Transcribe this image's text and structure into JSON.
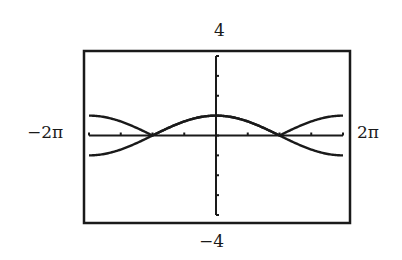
{
  "chart_data": {
    "type": "line",
    "title": "",
    "xlabel": "",
    "ylabel": "",
    "window": {
      "xmin_label": "-2π",
      "xmax_label": "2π",
      "ymin_label": "-4",
      "ymax_label": "4",
      "xmin": -6.2832,
      "xmax": 6.2832,
      "ymin": -4,
      "ymax": 4,
      "xscale_label": "π/2",
      "yscale": 1
    },
    "x_ticks": [
      "-3π/2",
      "-π",
      "-π/2",
      "0",
      "π/2",
      "π",
      "3π/2"
    ],
    "y_ticks": [
      -4,
      -3,
      -2,
      -1,
      0,
      1,
      2,
      3,
      4
    ],
    "grid": false,
    "legend": null,
    "series": [
      {
        "name": "y = cos(x/2)",
        "x": [
          -6.283,
          -4.712,
          -3.142,
          -1.571,
          0,
          1.571,
          3.142,
          4.712,
          6.283
        ],
        "y": [
          -1,
          -0.707,
          0,
          0.707,
          1,
          0.707,
          0,
          -0.707,
          -1
        ]
      },
      {
        "name": "y = |cos(x/2)|",
        "x": [
          -6.283,
          -4.712,
          -3.142,
          -1.571,
          0,
          1.571,
          3.142,
          4.712,
          6.283
        ],
        "y": [
          1,
          0.707,
          0,
          0.707,
          1,
          0.707,
          0,
          0.707,
          1
        ]
      }
    ],
    "annotations": [
      "curves intersect on x-axis at x = -π and x = π"
    ]
  },
  "labels": {
    "top": "4",
    "bottom": "−4",
    "left": "−2π",
    "right": "2π"
  },
  "colors": {
    "ink": "#1a1a1a",
    "background": "#ffffff"
  }
}
